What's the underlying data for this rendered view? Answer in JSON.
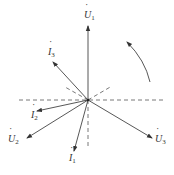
{
  "diagram": {
    "colors": {
      "line": "#444444",
      "dashed": "#555555",
      "background": "#ffffff"
    },
    "center": {
      "x": 88,
      "y": 100
    },
    "phasors": [
      {
        "id": "U1",
        "symbol": "U",
        "subscript": "1",
        "dot": true,
        "end": {
          "x": 88,
          "y": 26
        }
      },
      {
        "id": "U2",
        "symbol": "U",
        "subscript": "2",
        "dot": true,
        "end": {
          "x": 27,
          "y": 138
        }
      },
      {
        "id": "U3",
        "symbol": "U",
        "subscript": "3",
        "dot": true,
        "end": {
          "x": 152,
          "y": 138
        }
      },
      {
        "id": "I1",
        "symbol": "I",
        "subscript": "1",
        "dot": true,
        "end": {
          "x": 74,
          "y": 151
        }
      },
      {
        "id": "I2",
        "symbol": "I",
        "subscript": "2",
        "dot": true,
        "end": {
          "x": 37,
          "y": 111
        }
      },
      {
        "id": "I3",
        "symbol": "I",
        "subscript": "3",
        "dot": true,
        "end": {
          "x": 53,
          "y": 62
        }
      }
    ],
    "labels": {
      "U1": {
        "sym": "U",
        "sub": "1"
      },
      "U2": {
        "sym": "U",
        "sub": "2"
      },
      "U3": {
        "sym": "U",
        "sub": "3"
      },
      "I1": {
        "sym": "I",
        "sub": "1"
      },
      "I2": {
        "sym": "I",
        "sub": "2"
      },
      "I3": {
        "sym": "I",
        "sub": "3"
      }
    },
    "rotation_arrow": {
      "direction": "counterclockwise"
    }
  }
}
